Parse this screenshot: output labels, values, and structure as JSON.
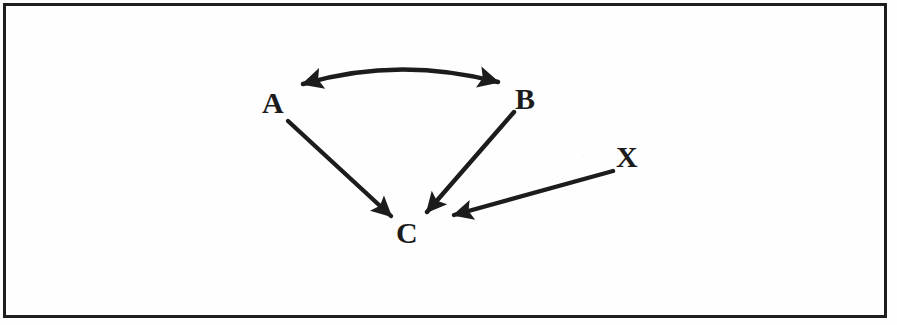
{
  "figure": {
    "type": "causal-diagram",
    "background_color": "#fefefe",
    "ink_color": "#1c1c1c",
    "border": {
      "present": true,
      "color": "#1e1e1e",
      "thickness_px": 3
    }
  },
  "nodes": [
    {
      "id": "A",
      "label": "A",
      "x": 272,
      "y": 103
    },
    {
      "id": "B",
      "label": "B",
      "x": 526,
      "y": 99
    },
    {
      "id": "C",
      "label": "C",
      "x": 408,
      "y": 233
    },
    {
      "id": "X",
      "label": "X",
      "x": 628,
      "y": 157
    }
  ],
  "edges": [
    {
      "id": "B-to-A",
      "from": "B",
      "to": "A",
      "style": "curved-arc",
      "arrowheads": "both",
      "description": "curved arc arching over A and B with arrowheads at both ends"
    },
    {
      "id": "A-to-C",
      "from": "A",
      "to": "C",
      "style": "straight",
      "arrowheads": "end",
      "description": "straight arrow from A down-right into C"
    },
    {
      "id": "B-to-C",
      "from": "B",
      "to": "C",
      "style": "straight",
      "arrowheads": "end",
      "description": "straight arrow from B down-left into C"
    },
    {
      "id": "X-to-C",
      "from": "X",
      "to": "C",
      "style": "straight",
      "arrowheads": "end",
      "description": "straight arrow from X down-left into C"
    }
  ]
}
